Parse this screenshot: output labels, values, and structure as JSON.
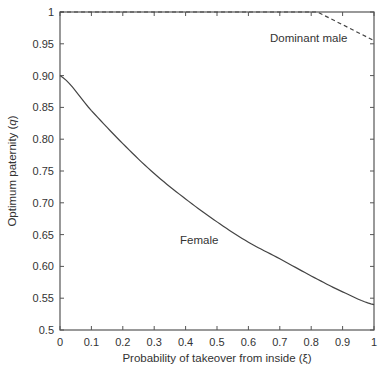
{
  "chart_data": {
    "type": "line",
    "title": "",
    "xlabel": "Probability of takeover from inside (ξ)",
    "ylabel": "Optimum paternity (q)",
    "ylabel_prefix": "Optimum paternity (",
    "ylabel_var": "q",
    "ylabel_suffix": ")",
    "xlim": [
      0,
      1
    ],
    "ylim": [
      0.5,
      1
    ],
    "grid": false,
    "legend": "none (inline annotations)",
    "xticks": [
      "0",
      "0.1",
      "0.2",
      "0.3",
      "0.4",
      "0.5",
      "0.6",
      "0.7",
      "0.8",
      "0.9",
      "1"
    ],
    "yticks": [
      "0.5",
      "0.55",
      "0.60",
      "0.65",
      "0.70",
      "0.75",
      "0.80",
      "0.85",
      "0.90",
      "0.95",
      "1"
    ],
    "series": [
      {
        "name": "Female",
        "style": "solid",
        "x": [
          0,
          0.1,
          0.2,
          0.3,
          0.4,
          0.5,
          0.6,
          0.7,
          0.8,
          0.9,
          1.0
        ],
        "y": [
          0.9,
          0.845,
          0.793,
          0.746,
          0.706,
          0.67,
          0.638,
          0.612,
          0.585,
          0.56,
          0.54
        ]
      },
      {
        "name": "Dominant male",
        "style": "dashed",
        "x": [
          0,
          0.82,
          1.0
        ],
        "y": [
          1.0,
          1.0,
          0.955
        ]
      }
    ],
    "annotations": [
      {
        "text": "Dominant male",
        "x": 0.87,
        "y": 0.975
      },
      {
        "text": "Female",
        "x": 0.41,
        "y": 0.635
      }
    ]
  }
}
